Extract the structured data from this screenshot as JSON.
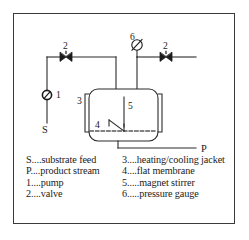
{
  "figure": {
    "background_color": "#ffffff",
    "frame_color": "#3a3a3a",
    "line_color": "#2b2b2b"
  },
  "diagram": {
    "labels": {
      "substrate_feed": "S",
      "product_stream": "P",
      "pump": "1",
      "valve_left": "2",
      "valve_right": "2",
      "jacket": "3",
      "membrane": "4",
      "stirrer": "5",
      "pressure_gauge": "6"
    },
    "components": [
      {
        "name": "pump",
        "symbol": "circle-with-slash",
        "number": "1"
      },
      {
        "name": "valve-left",
        "symbol": "bowtie-valve",
        "number": "2"
      },
      {
        "name": "valve-right",
        "symbol": "bowtie-valve",
        "number": "2"
      },
      {
        "name": "heating-cooling-jacket",
        "symbol": "side-jacket-bars",
        "number": "3"
      },
      {
        "name": "flat-membrane",
        "symbol": "dashed-horizontal-line",
        "number": "4"
      },
      {
        "name": "magnet-stirrer",
        "symbol": "shaft-with-angled-blade",
        "number": "5"
      },
      {
        "name": "pressure-gauge",
        "symbol": "circle-with-diagonal-needle",
        "number": "6"
      },
      {
        "name": "reactor-vessel",
        "symbol": "rounded-rectangle",
        "number": ""
      }
    ]
  },
  "legend": {
    "left_column": [
      {
        "key": "S",
        "dots": "....",
        "desc": "substrate feed"
      },
      {
        "key": "P",
        "dots": "....",
        "desc": "product stream"
      },
      {
        "key": "1",
        "dots": "....",
        "desc": "pump"
      },
      {
        "key": "2",
        "dots": "....",
        "desc": "valve"
      }
    ],
    "right_column": [
      {
        "key": "3",
        "dots": "....",
        "desc": "heating/cooling jacket"
      },
      {
        "key": "4",
        "dots": "....",
        "desc": "flat membrane"
      },
      {
        "key": "5",
        "dots": ".....",
        "desc": "magnet stirrer"
      },
      {
        "key": "6",
        "dots": ".....",
        "desc": "pressure gauge"
      }
    ]
  }
}
